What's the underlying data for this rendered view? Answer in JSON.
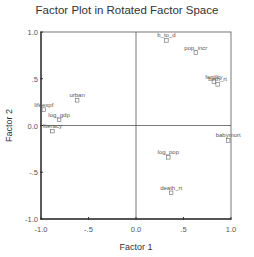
{
  "chart_data": {
    "type": "scatter",
    "title": "Factor Plot in Rotated Factor Space",
    "xlabel": "Factor 1",
    "ylabel": "Factor 2",
    "xlim": [
      -1.0,
      1.0
    ],
    "ylim": [
      -1.0,
      1.0
    ],
    "x_ticks": [
      "-1.0",
      "-.5",
      "0.0",
      ".5",
      "1.0"
    ],
    "y_ticks": [
      "1.0",
      ".5",
      "0.0",
      "-.5",
      "-1.0"
    ],
    "grid": false,
    "reference_lines": {
      "x": 0,
      "y": 0
    },
    "points": [
      {
        "label": "b_to_d",
        "x": 0.32,
        "y": 0.91
      },
      {
        "label": "pop_incr",
        "x": 0.63,
        "y": 0.78
      },
      {
        "label": "fertility",
        "x": 0.82,
        "y": 0.47
      },
      {
        "label": "birth_rt",
        "x": 0.86,
        "y": 0.44
      },
      {
        "label": "babymort",
        "x": 0.97,
        "y": -0.16
      },
      {
        "label": "log_pop",
        "x": 0.34,
        "y": -0.34
      },
      {
        "label": "death_rt",
        "x": 0.37,
        "y": -0.72
      },
      {
        "label": "urban",
        "x": -0.62,
        "y": 0.27
      },
      {
        "label": "lifeexpf",
        "x": -0.97,
        "y": 0.17
      },
      {
        "label": "log_gdp",
        "x": -0.81,
        "y": 0.06
      },
      {
        "label": "literacy",
        "x": -0.88,
        "y": -0.06
      }
    ]
  }
}
